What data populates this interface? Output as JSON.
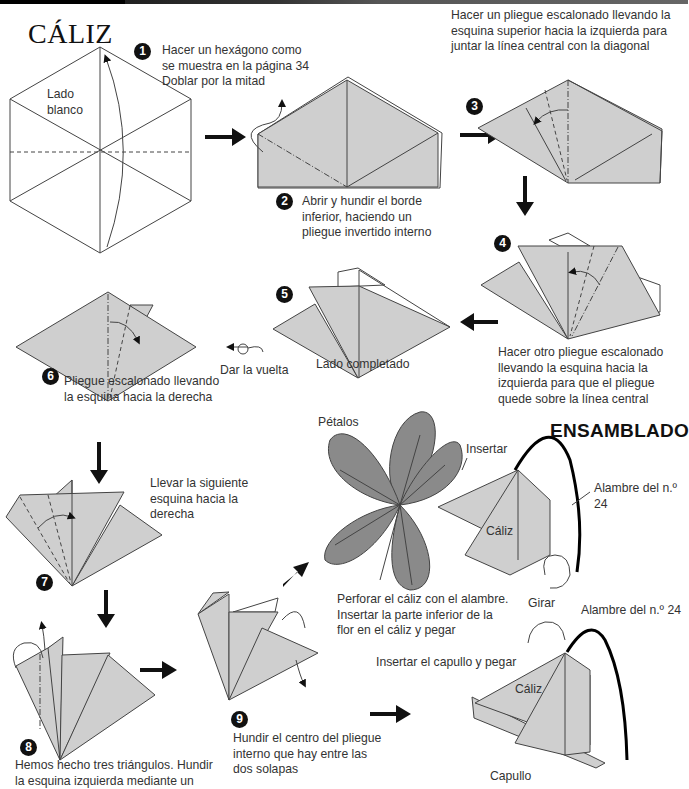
{
  "page": {
    "title": "CÁLIZ",
    "assembly_heading": "ENSAMBLADO"
  },
  "steps": [
    {
      "number": "1",
      "lines": [
        "Hacer un hexágono como",
        "se muestra en la página 34",
        "Doblar por la mitad"
      ]
    },
    {
      "number": "2",
      "lines": [
        "Abrir y hundir el borde",
        "inferior, haciendo un",
        "pliegue invertido interno"
      ]
    },
    {
      "number": "3",
      "lines": [
        "Hacer un pliegue escalonado llevando la",
        "esquina superior hacia la izquierda para",
        "juntar la línea central con la diagonal"
      ]
    },
    {
      "number": "4",
      "lines": [
        "Hacer otro pliegue escalonado",
        "llevando la esquina hacia la",
        "izquierda para que el pliegue",
        "quede sobre la línea central"
      ]
    },
    {
      "number": "5",
      "lines": [
        "Lado completado"
      ]
    },
    {
      "number": "6",
      "lines": [
        "Pliegue escalonado llevando",
        "la esquina hacia la derecha"
      ]
    },
    {
      "number": "7",
      "lines": [
        "Llevar la siguiente",
        "esquina hacia la",
        "derecha"
      ]
    },
    {
      "number": "8",
      "lines": [
        "Hemos hecho tres triángulos. Hundir",
        "la esquina izquierda mediante un"
      ]
    },
    {
      "number": "9",
      "lines": [
        "Hundir el centro del pliegue",
        "interno que hay entre las",
        "dos solapas"
      ]
    }
  ],
  "labels": {
    "white_side": [
      "Lado",
      "blanco"
    ],
    "turn_over": "Dar la vuelta",
    "petals": "Pétalos",
    "insert": "Insertar",
    "wire_top": "Alambre del n.º 24",
    "caliz_top": "Cáliz",
    "rotate": "Girar",
    "assembly_instructions": [
      "Perforar el cáliz con el alambre.",
      "Insertar la parte inferior de la",
      "flor en el cáliz y pegar"
    ],
    "wire_bottom": "Alambre del n.º 24",
    "insert_bud": "Insertar el capullo y pegar",
    "caliz_bottom": "Cáliz",
    "bud": "Capullo"
  },
  "colors": {
    "paper": "#cfcfcf",
    "petals": "#8a8a8a",
    "ink": "#111111"
  }
}
